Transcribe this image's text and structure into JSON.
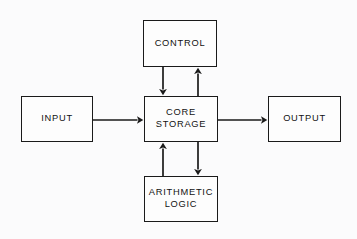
{
  "diagram": {
    "background_color": "#fbfbfc",
    "line_color": "#1a1a1a",
    "text_color": "#121212",
    "nodes": [
      {
        "id": "control",
        "label": "CONTROL",
        "x": 143,
        "y": 20,
        "width": 74,
        "height": 47
      },
      {
        "id": "input",
        "label": "INPUT",
        "x": 21,
        "y": 96,
        "width": 72,
        "height": 46
      },
      {
        "id": "core-storage",
        "label": "CORE\nSTORAGE",
        "x": 144,
        "y": 96,
        "width": 74,
        "height": 46
      },
      {
        "id": "output",
        "label": "OUTPUT",
        "x": 268,
        "y": 96,
        "width": 73,
        "height": 46
      },
      {
        "id": "arithmetic-logic",
        "label": "ARITHMETIC\nLOGIC",
        "x": 144,
        "y": 176,
        "width": 74,
        "height": 46
      }
    ],
    "connectors": [
      {
        "id": "control-to-core",
        "from": "control",
        "to": "core-storage",
        "direction": "down",
        "x1": 163,
        "y1": 67,
        "x2": 163,
        "y2": 96
      },
      {
        "id": "core-to-control",
        "from": "core-storage",
        "to": "control",
        "direction": "up",
        "x1": 198,
        "y1": 96,
        "x2": 198,
        "y2": 67
      },
      {
        "id": "input-to-core",
        "from": "input",
        "to": "core-storage",
        "direction": "right",
        "x1": 93,
        "y1": 120,
        "x2": 144,
        "y2": 120
      },
      {
        "id": "core-to-output",
        "from": "core-storage",
        "to": "output",
        "direction": "right",
        "x1": 218,
        "y1": 120,
        "x2": 268,
        "y2": 120
      },
      {
        "id": "arithmetic-to-core",
        "from": "arithmetic-logic",
        "to": "core-storage",
        "direction": "up",
        "x1": 163,
        "y1": 176,
        "x2": 163,
        "y2": 142
      },
      {
        "id": "core-to-arithmetic",
        "from": "core-storage",
        "to": "arithmetic-logic",
        "direction": "down",
        "x1": 198,
        "y1": 142,
        "x2": 198,
        "y2": 176
      }
    ]
  }
}
